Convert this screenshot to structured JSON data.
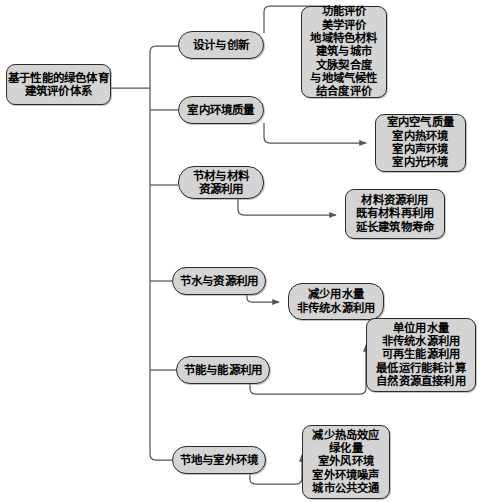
{
  "diagram": {
    "type": "tree-mindmap",
    "orientation": "left-to-right",
    "colors": {
      "node_fill": "#d4d4d4",
      "node_border": "#2b2b2b",
      "connector": "#555555",
      "background": "#ffffff"
    },
    "root": {
      "id": "root",
      "label": "基于性能的绿色体育\n建筑评价体系"
    },
    "branches": [
      {
        "id": "design",
        "label": "设计与创新",
        "leaf": {
          "id": "design-items",
          "shape": "rounded-rect",
          "label": "功能评价\n美学评价\n地域特色材料\n建筑与城市\n文脉契合度\n与地域气候性\n结合度评价",
          "items": [
            "功能评价",
            "美学评价",
            "地域特色材料",
            "建筑与城市",
            "文脉契合度",
            "与地域气候性",
            "结合度评价"
          ]
        }
      },
      {
        "id": "indoor",
        "label": "室内环境质量",
        "leaf": {
          "id": "indoor-items",
          "shape": "rounded-rect",
          "label": "室内空气质量\n室内热环境\n室内声环境\n室内光环境",
          "items": [
            "室内空气质量",
            "室内热环境",
            "室内声环境",
            "室内光环境"
          ]
        }
      },
      {
        "id": "material",
        "label": "节材与材料\n资源利用",
        "leaf": {
          "id": "material-items",
          "shape": "rounded-rect",
          "label": "材料资源利用\n既有材料再利用\n延长建筑物寿命",
          "items": [
            "材料资源利用",
            "既有材料再利用",
            "延长建筑物寿命"
          ]
        }
      },
      {
        "id": "water",
        "label": "节水与资源利用",
        "leaf": {
          "id": "water-items",
          "shape": "pill",
          "label": "减少用水量\n非传统水源利用",
          "items": [
            "减少用水量",
            "非传统水源利用"
          ]
        }
      },
      {
        "id": "energy",
        "label": "节能与能源利用",
        "leaf": {
          "id": "energy-items",
          "shape": "rounded-rect",
          "label": "单位用水量\n非传统水源利用\n可再生能源利用\n最低运行能耗计算\n自然资源直接利用",
          "items": [
            "单位用水量",
            "非传统水源利用",
            "可再生能源利用",
            "最低运行能耗计算",
            "自然资源直接利用"
          ]
        }
      },
      {
        "id": "land",
        "label": "节地与室外环境",
        "leaf": {
          "id": "land-items",
          "shape": "rounded-rect",
          "label": "减少热岛效应\n绿化量\n室外风环境\n室外环境噪声\n城市公共交通",
          "items": [
            "减少热岛效应",
            "绿化量",
            "室外风环境",
            "室外环境噪声",
            "城市公共交通"
          ]
        }
      }
    ]
  }
}
